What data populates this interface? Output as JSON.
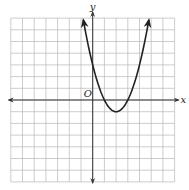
{
  "chart_data": {
    "type": "line",
    "title": "",
    "xlabel": "x",
    "ylabel": "y",
    "origin_label": "O",
    "xlim": [
      -7,
      7
    ],
    "ylim": [
      -7,
      7
    ],
    "grid": true,
    "grid_step": 1,
    "legend": null,
    "series": [
      {
        "name": "parabola",
        "equation": "y = x^2 - 4x + 3",
        "vertex": [
          2,
          -1
        ],
        "roots": [
          1,
          3
        ],
        "y_intercept": 3,
        "domain": [
          -0.8,
          4.8
        ],
        "opens": "up",
        "end_arrows": true,
        "x": [
          -0.8,
          0,
          0.5,
          1,
          1.5,
          2,
          2.5,
          3,
          3.5,
          4,
          4.8
        ],
        "y": [
          6.84,
          3,
          1.25,
          0,
          -0.75,
          -1,
          -0.75,
          0,
          1.25,
          3,
          6.84
        ]
      }
    ]
  },
  "colors": {
    "grid": "#b8b8b8",
    "axis": "#333333",
    "curve": "#222222",
    "background": "#ffffff"
  }
}
